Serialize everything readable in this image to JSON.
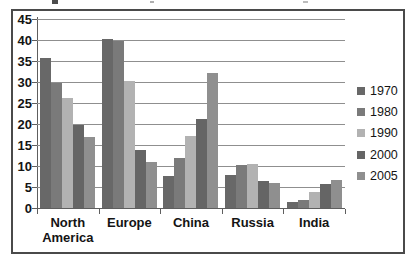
{
  "chart_data": {
    "type": "bar",
    "title": "",
    "categories": [
      "North America",
      "Europe",
      "China",
      "Russia",
      "India"
    ],
    "series": [
      {
        "name": "1970",
        "color": "#686868",
        "values": [
          36,
          40.5,
          7.8,
          8.1,
          1.6
        ]
      },
      {
        "name": "1980",
        "color": "#7a7a7a",
        "values": [
          30,
          40,
          12.2,
          10.4,
          2.2
        ]
      },
      {
        "name": "1990",
        "color": "#b2b2b2",
        "values": [
          26.5,
          30.5,
          17.4,
          10.8,
          4
        ]
      },
      {
        "name": "2000",
        "color": "#656565",
        "values": [
          20,
          14,
          21.5,
          6.6,
          6
        ]
      },
      {
        "name": "2005",
        "color": "#8f8f8f",
        "values": [
          17.2,
          11.2,
          32.5,
          6.2,
          6.8
        ]
      }
    ],
    "xlabel": "",
    "ylabel": "",
    "ylim": [
      0,
      45
    ],
    "yticks": [
      0,
      5,
      10,
      15,
      20,
      25,
      30,
      35,
      40,
      45
    ],
    "grid": true,
    "legend_position": "right",
    "grid_color": "#8f8f8f",
    "axis_color": "#5e5e5e",
    "text_color": "#141414",
    "border_color": "#4a4a4a"
  }
}
